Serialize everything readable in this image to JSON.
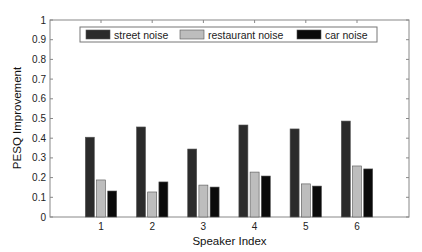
{
  "chart_data": {
    "type": "bar",
    "title": "",
    "xlabel": "Speaker Index",
    "ylabel": "PESQ Improvement",
    "categories": [
      "1",
      "2",
      "3",
      "4",
      "5",
      "6"
    ],
    "series": [
      {
        "name": "street noise",
        "color": "#2b2b2b",
        "values": [
          0.405,
          0.457,
          0.345,
          0.467,
          0.447,
          0.487
        ]
      },
      {
        "name": "restaurant noise",
        "color": "#bdbdbd",
        "values": [
          0.188,
          0.127,
          0.162,
          0.228,
          0.168,
          0.259
        ]
      },
      {
        "name": "car noise",
        "color": "#0a0a0a",
        "values": [
          0.132,
          0.178,
          0.152,
          0.208,
          0.157,
          0.244
        ]
      }
    ],
    "ylim": [
      0,
      1
    ],
    "yticks": [
      "0",
      "0.1",
      "0.2",
      "0.3",
      "0.4",
      "0.5",
      "0.6",
      "0.7",
      "0.8",
      "0.9",
      "1"
    ],
    "grid": false,
    "legend_position": "top, horizontal inside plot"
  }
}
